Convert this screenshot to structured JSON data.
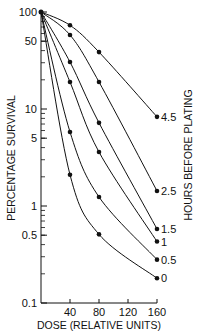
{
  "chart_data": {
    "type": "line",
    "title": "",
    "xlabel": "DOSE (RELATIVE UNITS)",
    "ylabel": "PERCENTAGE SURVIVAL",
    "right_label": "HOURS BEFORE PLATING",
    "x": [
      0,
      40,
      80,
      160
    ],
    "xticks": [
      40,
      80,
      120,
      160
    ],
    "xtick_labels": [
      "40",
      "80",
      "120",
      "160"
    ],
    "yticks": [
      0.1,
      0.5,
      1,
      5,
      10,
      50,
      100
    ],
    "ytick_labels": [
      "0.1",
      "0.5",
      "1",
      "5",
      "10",
      "50",
      "100"
    ],
    "yscale": "log",
    "xlim": [
      0,
      160
    ],
    "ylim": [
      0.1,
      100
    ],
    "grid": false,
    "legend_position": "inline-right",
    "series": [
      {
        "name": "4.5",
        "values": [
          100,
          73,
          38.6,
          8.3
        ]
      },
      {
        "name": "2.5",
        "values": [
          100,
          58,
          19,
          1.43
        ]
      },
      {
        "name": "1.5",
        "values": [
          100,
          30.5,
          7.2,
          0.58
        ]
      },
      {
        "name": "1",
        "values": [
          100,
          19,
          3.6,
          0.43
        ]
      },
      {
        "name": "0.5",
        "values": [
          100,
          5.8,
          1.24,
          0.28
        ]
      },
      {
        "name": "0",
        "values": [
          100,
          2.1,
          0.51,
          0.18
        ]
      }
    ]
  }
}
